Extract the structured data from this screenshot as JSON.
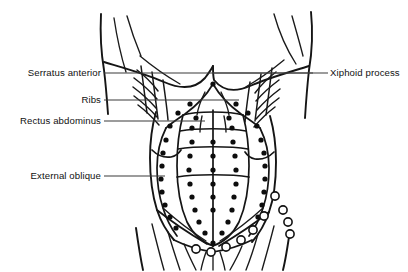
{
  "figure": {
    "background_color": "#ffffff",
    "ink_color": "#111111",
    "width": 408,
    "height": 272
  },
  "labels": [
    {
      "id": "serratus-anterior",
      "text": "Serratus anterior",
      "side": "left",
      "text_x": 101,
      "text_y": 76,
      "leader": {
        "x1": 104,
        "y1": 73,
        "x2": 313,
        "y2": 73
      }
    },
    {
      "id": "ribs",
      "text": "Ribs",
      "side": "left",
      "text_x": 101,
      "text_y": 103,
      "leader": {
        "x1": 104,
        "y1": 100,
        "x2": 239,
        "y2": 100
      }
    },
    {
      "id": "rectus-abdominus",
      "text": "Rectus abdominus",
      "side": "left",
      "text_x": 101,
      "text_y": 124,
      "leader": {
        "x1": 104,
        "y1": 121,
        "x2": 205,
        "y2": 121
      }
    },
    {
      "id": "external-oblique",
      "text": "External oblique",
      "side": "left",
      "text_x": 101,
      "text_y": 179,
      "leader": {
        "x1": 104,
        "y1": 176,
        "x2": 165,
        "y2": 176
      }
    },
    {
      "id": "xiphoid-process",
      "text": "Xiphoid process",
      "side": "right",
      "text_x": 330,
      "text_y": 76,
      "leader": {
        "x1": 213,
        "y1": 73,
        "x2": 328,
        "y2": 73
      }
    }
  ],
  "marker_points": {
    "filled_color": "#0d0d0d",
    "open_color": "#ffffff",
    "filled_radius": 2.6,
    "open_radius": 4.1,
    "filled": [
      [
        213,
        84
      ],
      [
        190,
        104
      ],
      [
        236,
        104
      ],
      [
        178,
        113
      ],
      [
        248,
        113
      ],
      [
        196,
        118
      ],
      [
        229,
        118
      ],
      [
        170,
        126
      ],
      [
        257,
        126
      ],
      [
        192,
        128
      ],
      [
        232,
        128
      ],
      [
        166,
        140
      ],
      [
        261,
        140
      ],
      [
        192,
        142
      ],
      [
        213,
        142
      ],
      [
        233,
        142
      ],
      [
        163,
        153
      ],
      [
        264,
        153
      ],
      [
        190,
        156
      ],
      [
        213,
        156
      ],
      [
        235,
        156
      ],
      [
        162,
        166
      ],
      [
        265,
        166
      ],
      [
        189,
        170
      ],
      [
        213,
        170
      ],
      [
        236,
        170
      ],
      [
        161,
        179
      ],
      [
        265,
        179
      ],
      [
        190,
        184
      ],
      [
        213,
        184
      ],
      [
        236,
        184
      ],
      [
        162,
        192
      ],
      [
        264,
        192
      ],
      [
        192,
        197
      ],
      [
        213,
        197
      ],
      [
        234,
        197
      ],
      [
        165,
        205
      ],
      [
        262,
        205
      ],
      [
        195,
        210
      ],
      [
        213,
        210
      ],
      [
        232,
        210
      ],
      [
        170,
        217
      ],
      [
        258,
        217
      ],
      [
        199,
        222
      ],
      [
        228,
        222
      ],
      [
        176,
        228
      ],
      [
        252,
        228
      ],
      [
        205,
        233
      ],
      [
        222,
        233
      ],
      [
        213,
        243
      ]
    ],
    "open": [
      [
        275,
        196
      ],
      [
        283,
        210
      ],
      [
        288,
        222
      ],
      [
        290,
        234
      ],
      [
        264,
        216
      ],
      [
        253,
        230
      ],
      [
        241,
        240
      ],
      [
        226,
        247
      ],
      [
        211,
        252
      ],
      [
        196,
        249
      ]
    ]
  },
  "anatomy_regions": [
    {
      "id": "left-arm",
      "name": "left arm outline"
    },
    {
      "id": "right-arm",
      "name": "right arm outline"
    },
    {
      "id": "left-pectoral",
      "name": "left pectoral / breast contour"
    },
    {
      "id": "right-pectoral",
      "name": "right pectoral / breast contour"
    },
    {
      "id": "rib-cage",
      "name": "costal margin"
    },
    {
      "id": "serratus-digitations",
      "name": "serratus anterior digitations"
    },
    {
      "id": "rectus-sheath",
      "name": "rectus abdominus sheath"
    },
    {
      "id": "tendinous-intersections",
      "name": "tendinous intersections"
    },
    {
      "id": "linea-alba",
      "name": "linea alba"
    },
    {
      "id": "external-oblique-left",
      "name": "left external oblique"
    },
    {
      "id": "external-oblique-right",
      "name": "right external oblique"
    },
    {
      "id": "inguinal-region",
      "name": "inguinal ligament region"
    },
    {
      "id": "thigh-left",
      "name": "left thigh outline"
    },
    {
      "id": "thigh-right",
      "name": "right thigh outline"
    }
  ]
}
